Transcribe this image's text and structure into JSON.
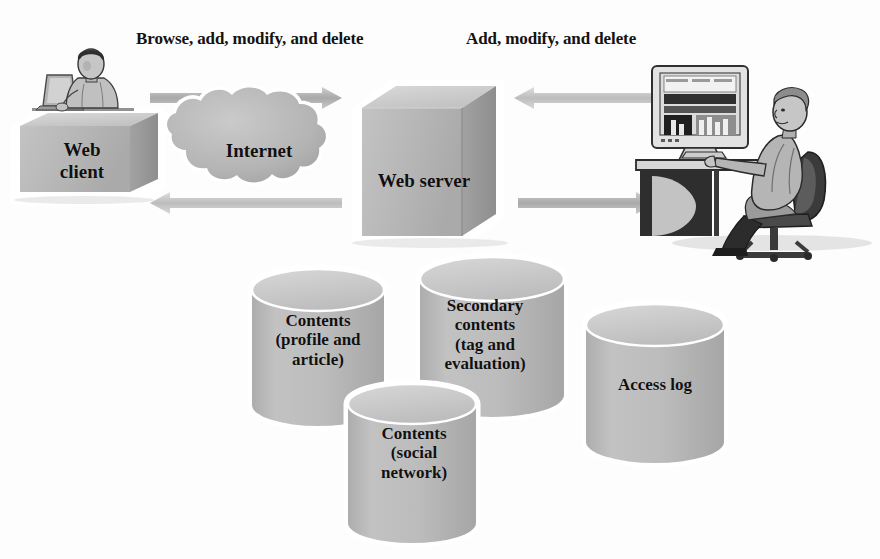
{
  "diagram": {
    "background_color": "#fdfdfd",
    "fill_color": "#b9b9b9",
    "shade_color": "#9c9c9c",
    "highlight_color": "#d6d6d6",
    "outline_color": "#ffffff",
    "text_color": "#111010",
    "flow_labels": [
      {
        "id": "browse",
        "text": "Browse, add, modify, and delete"
      },
      {
        "id": "admin",
        "text": "Add, modify, and delete"
      }
    ],
    "nodes": [
      {
        "id": "web-client",
        "label": "Web\nclient",
        "shape": "box-3d"
      },
      {
        "id": "internet",
        "label": "Internet",
        "shape": "cloud"
      },
      {
        "id": "web-server",
        "label": "Web server",
        "shape": "cube-3d"
      },
      {
        "id": "web-client-user",
        "label": "person-at-laptop-icon",
        "shape": "illustration"
      },
      {
        "id": "administrator",
        "label": "person-at-desktop-icon",
        "shape": "illustration"
      }
    ],
    "databases": [
      {
        "id": "contents",
        "label": "Contents\n(profile and\narticle)",
        "shape": "cylinder"
      },
      {
        "id": "secondary-contents",
        "label": "Secondary\ncontents\n(tag and\nevaluation)",
        "shape": "cylinder"
      },
      {
        "id": "contents-social",
        "label": "Contents\n(social\nnetwork)",
        "shape": "cylinder"
      },
      {
        "id": "access-log",
        "label": "Access log",
        "shape": "cylinder"
      }
    ],
    "arrows": [
      {
        "id": "client-to-server",
        "direction": "right",
        "from": "web-client",
        "to": "web-server"
      },
      {
        "id": "server-to-client",
        "direction": "left",
        "from": "web-server",
        "to": "web-client"
      },
      {
        "id": "admin-to-server",
        "direction": "left",
        "from": "administrator",
        "to": "web-server"
      },
      {
        "id": "server-to-admin",
        "direction": "right",
        "from": "web-server",
        "to": "administrator"
      }
    ]
  }
}
